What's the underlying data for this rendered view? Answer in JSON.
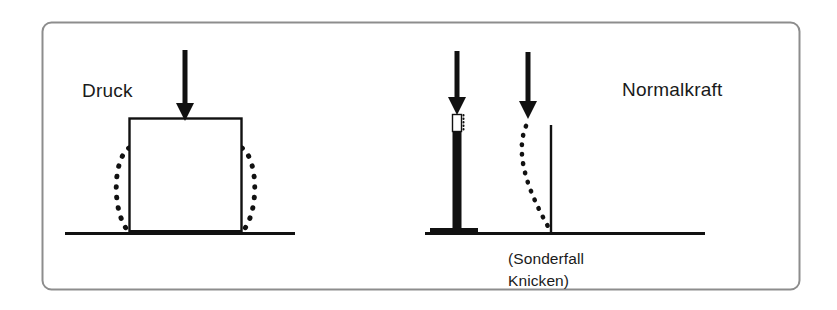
{
  "figure": {
    "name": "druck-normalkraft-diagram",
    "background_color": "#ffffff",
    "ink_color": "#111111",
    "frame": {
      "name": "outer-frame",
      "stroke_color": "#8a8a8a",
      "x": 42,
      "y": 22,
      "width": 758,
      "height": 268,
      "corner_radius": 9
    },
    "labels": {
      "left_label": "Druck",
      "right_label": "Normalkraft",
      "caption_line1": "(Sonderfall",
      "caption_line2": "Knicken)"
    },
    "left_panel": {
      "name": "compression-block-panel",
      "ground_line": {
        "x1": 65,
        "x2": 295,
        "y": 233
      },
      "block": {
        "x": 129,
        "y": 118,
        "width": 113,
        "height": 115
      },
      "load_arrow": {
        "x": 185,
        "y_top": 50,
        "y_tip": 121
      },
      "deformed_outline_note": "dotted bulged outline of squashed block",
      "deformed_top_y": 148,
      "bulge_offset": 14
    },
    "right_panel": {
      "name": "normal-force-column-panel",
      "ground_line": {
        "x1": 425,
        "x2": 705,
        "y": 233
      },
      "column_solid": {
        "x": 453,
        "y_top": 131,
        "y_bottom": 231,
        "width": 9,
        "fill": "#111111"
      },
      "column_unloaded_segment": {
        "x": 453,
        "y_top": 114,
        "y_bottom": 131,
        "width": 9,
        "fill": "#ffffff"
      },
      "column_base_plate": {
        "x1": 430,
        "x2": 478,
        "y": 231
      },
      "load_arrow_1": {
        "x": 457,
        "y_top": 51,
        "y_tip": 114
      },
      "load_arrow_2": {
        "x": 528,
        "y_top": 52,
        "y_tip": 119
      },
      "buckling_column": {
        "x": 551,
        "y_top": 125,
        "y_bottom": 233
      },
      "buckled_shape_note": "dotted curve from upper-left bowing to the column base"
    }
  }
}
